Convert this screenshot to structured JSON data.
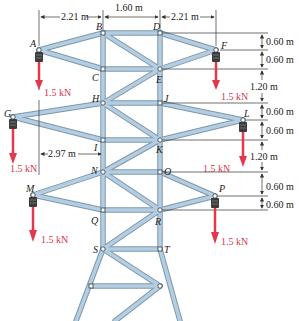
{
  "figure": {
    "colors": {
      "member": "#a9c3d6",
      "member_edge": "#6f8ea6",
      "joint_fill": "#ffffff",
      "joint_edge": "#3a4a58",
      "load_arrow": "#e23a4c",
      "insulator": "#3b3b3b",
      "dimension_line": "#333333"
    },
    "joints": {
      "A": "A",
      "B": "B",
      "C": "C",
      "D": "D",
      "E": "E",
      "F": "F",
      "G": "G",
      "H": "H",
      "I": "I",
      "J": "J",
      "K": "K",
      "L": "L",
      "M": "M",
      "N": "N",
      "O": "O",
      "P": "P",
      "Q": "Q",
      "R": "R",
      "S": "S",
      "T": "T"
    },
    "top_dimensions": {
      "left": "2.21 m",
      "middle": "1.60 m",
      "right": "2.21 m"
    },
    "left_dimension": {
      "g_arm": "2.97 m"
    },
    "right_dimensions": [
      "0.60 m",
      "0.60 m",
      "1.20 m",
      "0.60 m",
      "0.60 m",
      "1.20 m",
      "0.60 m",
      "0.60 m"
    ],
    "loads": {
      "A": "1.5 kN",
      "F": "1.5 kN",
      "G": "1.5 kN",
      "L": "1.5 kN",
      "M": "1.5 kN",
      "P": "1.5 kN"
    }
  }
}
